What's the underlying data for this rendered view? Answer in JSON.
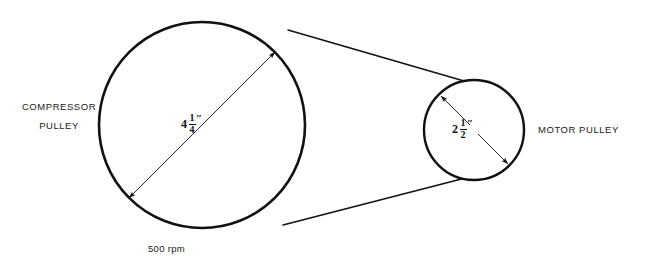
{
  "diagram": {
    "type": "belt-drive-pulley-diagram",
    "background_color": "#ffffff",
    "line_color": "#111111",
    "pulleys": [
      {
        "id": "compressor",
        "name_line1": "COMPRESSOR",
        "name_line2": "PULLEY",
        "diameter_whole": "4",
        "diameter_numerator": "1",
        "diameter_denominator": "4",
        "diameter_unit": "″",
        "speed": "500 rpm",
        "center_x": 202,
        "center_y": 125,
        "radius": 103
      },
      {
        "id": "motor",
        "name_line1": "MOTOR PULLEY",
        "diameter_whole": "2",
        "diameter_numerator": "1",
        "diameter_denominator": "2",
        "diameter_unit": "″",
        "center_x": 474,
        "center_y": 130,
        "radius": 50
      }
    ],
    "belt": {
      "upper_start_x": 288,
      "upper_start_y": 30,
      "upper_end_x": 509,
      "upper_end_y": 94,
      "lower_start_x": 283,
      "lower_start_y": 225,
      "lower_end_x": 508,
      "lower_end_y": 167
    }
  }
}
